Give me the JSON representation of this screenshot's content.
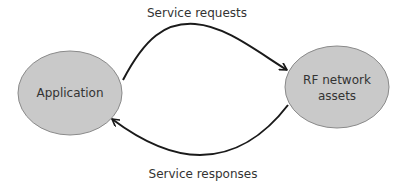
{
  "diagram": {
    "colors": {
      "node_fill": "#c9c9c9",
      "node_stroke": "#8a8a8a",
      "edge_stroke": "#1a1a1a",
      "text": "#333333"
    },
    "nodes": [
      {
        "id": "application",
        "label_lines": [
          "Application"
        ]
      },
      {
        "id": "rf-network-assets",
        "label_lines": [
          "RF network",
          "assets"
        ]
      }
    ],
    "edges": [
      {
        "id": "service-requests",
        "from": "application",
        "to": "rf-network-assets",
        "label": "Service requests"
      },
      {
        "id": "service-responses",
        "from": "rf-network-assets",
        "to": "application",
        "label": "Service responses"
      }
    ]
  }
}
